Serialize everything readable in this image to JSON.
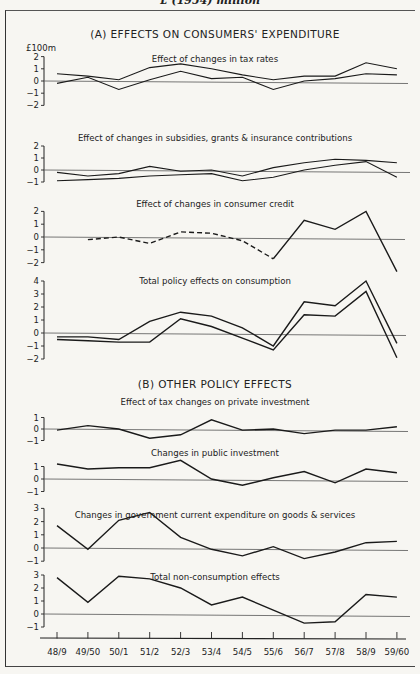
{
  "page_title": "£ (1954) million",
  "section_a_title": "(A) EFFECTS ON CONSUMERS' EXPENDITURE",
  "section_b_title": "(B) OTHER POLICY EFFECTS",
  "unit_label": "£100m",
  "chart_data": [
    {
      "type": "line",
      "title": "Effect of changes in tax rates",
      "section": "A",
      "categories": [
        "48/9",
        "49/50",
        "50/1",
        "51/2",
        "52/3",
        "53/4",
        "54/5",
        "55/6",
        "56/7",
        "57/8",
        "58/9",
        "59/60"
      ],
      "ylabel": "£100m",
      "yticks": [
        2,
        1,
        0,
        -1,
        -2
      ],
      "ylim": [
        -2,
        2
      ],
      "series": [
        {
          "name": "upper",
          "values": [
            0.6,
            0.4,
            0.1,
            1.1,
            1.4,
            1.0,
            0.5,
            0.1,
            0.4,
            0.4,
            1.5,
            1.0
          ]
        },
        {
          "name": "lower",
          "values": [
            -0.2,
            0.3,
            -0.7,
            0.1,
            0.8,
            0.2,
            0.3,
            -0.7,
            0.0,
            0.2,
            0.6,
            0.5
          ]
        }
      ]
    },
    {
      "type": "line",
      "title": "Effect of changes in subsidies, grants & insurance contributions",
      "section": "A",
      "categories": [
        "48/9",
        "49/50",
        "50/1",
        "51/2",
        "52/3",
        "53/4",
        "54/5",
        "55/6",
        "56/7",
        "57/8",
        "58/9",
        "59/60"
      ],
      "yticks": [
        2,
        1,
        0,
        -1
      ],
      "ylim": [
        -1,
        2
      ],
      "series": [
        {
          "name": "upper",
          "values": [
            -0.2,
            -0.5,
            -0.3,
            0.3,
            -0.1,
            0.0,
            -0.5,
            0.2,
            0.6,
            0.9,
            0.8,
            0.6
          ]
        },
        {
          "name": "lower",
          "values": [
            -0.9,
            -0.8,
            -0.7,
            -0.5,
            -0.4,
            -0.3,
            -0.9,
            -0.6,
            0.0,
            0.4,
            0.7,
            -0.6
          ]
        }
      ]
    },
    {
      "type": "line",
      "title": "Effect of changes in consumer credit",
      "section": "A",
      "categories": [
        "48/9",
        "49/50",
        "50/1",
        "51/2",
        "52/3",
        "53/4",
        "54/5",
        "55/6",
        "56/7",
        "57/8",
        "58/9",
        "59/60"
      ],
      "yticks": [
        2,
        1,
        0,
        -1,
        -2
      ],
      "ylim": [
        -2,
        2
      ],
      "series": [
        {
          "name": "estimated (dashed)",
          "values": [
            null,
            -0.2,
            0.0,
            -0.5,
            0.4,
            0.3,
            -0.3,
            -1.7,
            null,
            null,
            null,
            null
          ],
          "dashed": true
        },
        {
          "name": "actual (solid)",
          "values": [
            null,
            null,
            null,
            null,
            null,
            null,
            null,
            -1.7,
            1.3,
            0.6,
            2.0,
            -2.7
          ]
        }
      ]
    },
    {
      "type": "line",
      "title": "Total policy effects on consumption",
      "section": "A",
      "categories": [
        "48/9",
        "49/50",
        "50/1",
        "51/2",
        "52/3",
        "53/4",
        "54/5",
        "55/6",
        "56/7",
        "57/8",
        "58/9",
        "59/60"
      ],
      "yticks": [
        4,
        3,
        2,
        1,
        0,
        -1,
        -2
      ],
      "ylim": [
        -2,
        4
      ],
      "series": [
        {
          "name": "upper",
          "values": [
            -0.3,
            -0.3,
            -0.5,
            0.9,
            1.6,
            1.3,
            0.4,
            -1.0,
            2.4,
            2.1,
            4.0,
            -0.8
          ]
        },
        {
          "name": "lower",
          "values": [
            -0.5,
            -0.6,
            -0.7,
            -0.7,
            1.1,
            0.5,
            -0.4,
            -1.3,
            1.4,
            1.3,
            3.2,
            -1.9
          ]
        }
      ]
    },
    {
      "type": "line",
      "title": "Effect of tax changes on private investment",
      "section": "B",
      "categories": [
        "48/9",
        "49/50",
        "50/1",
        "51/2",
        "52/3",
        "53/4",
        "54/5",
        "55/6",
        "56/7",
        "57/8",
        "58/9",
        "59/60"
      ],
      "yticks": [
        1,
        0,
        -1
      ],
      "ylim": [
        -1,
        1
      ],
      "series": [
        {
          "name": "value",
          "values": [
            -0.1,
            0.3,
            0.0,
            -0.8,
            -0.5,
            0.8,
            -0.1,
            0.0,
            -0.4,
            -0.1,
            -0.1,
            0.2
          ]
        }
      ]
    },
    {
      "type": "line",
      "title": "Changes in public investment",
      "section": "B",
      "categories": [
        "48/9",
        "49/50",
        "50/1",
        "51/2",
        "52/3",
        "53/4",
        "54/5",
        "55/6",
        "56/7",
        "57/8",
        "58/9",
        "59/60"
      ],
      "yticks": [
        1,
        0,
        -1
      ],
      "ylim": [
        -1,
        1
      ],
      "series": [
        {
          "name": "value",
          "values": [
            1.2,
            0.8,
            0.9,
            0.9,
            1.5,
            0.0,
            -0.5,
            0.1,
            0.6,
            -0.3,
            0.8,
            0.5
          ]
        }
      ]
    },
    {
      "type": "line",
      "title": "Changes in government current expenditure on goods & services",
      "section": "B",
      "categories": [
        "48/9",
        "49/50",
        "50/1",
        "51/2",
        "52/3",
        "53/4",
        "54/5",
        "55/6",
        "56/7",
        "57/8",
        "58/9",
        "59/60"
      ],
      "yticks": [
        3,
        2,
        1,
        0,
        -1
      ],
      "ylim": [
        -1,
        3
      ],
      "series": [
        {
          "name": "value",
          "values": [
            1.7,
            -0.1,
            2.1,
            2.7,
            0.8,
            -0.1,
            -0.6,
            0.1,
            -0.8,
            -0.3,
            0.4,
            0.5
          ]
        }
      ]
    },
    {
      "type": "line",
      "title": "Total non-consumption effects",
      "section": "B",
      "categories": [
        "48/9",
        "49/50",
        "50/1",
        "51/2",
        "52/3",
        "53/4",
        "54/5",
        "55/6",
        "56/7",
        "57/8",
        "58/9",
        "59/60"
      ],
      "yticks": [
        3,
        2,
        1,
        0,
        -1
      ],
      "ylim": [
        -1,
        3
      ],
      "series": [
        {
          "name": "value",
          "values": [
            2.8,
            0.9,
            2.9,
            2.7,
            2.0,
            0.7,
            1.3,
            0.3,
            -0.7,
            -0.6,
            1.5,
            1.3
          ]
        }
      ]
    }
  ],
  "xaxis": {
    "tick_labels": [
      "48/9",
      "49/50",
      "50/1",
      "51/2",
      "52/3",
      "53/4",
      "54/5",
      "55/6",
      "56/7",
      "57/8",
      "58/9",
      "59/60"
    ]
  }
}
